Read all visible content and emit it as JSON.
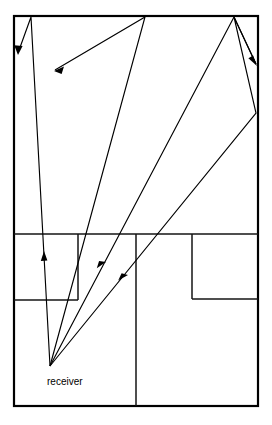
{
  "figure": {
    "type": "ray-diagram",
    "canvas": {
      "width": 272,
      "height": 425,
      "background": "#ffffff"
    },
    "stroke_color": "#000000",
    "labels": [
      {
        "id": "receiver",
        "text": "receiver",
        "x": 47,
        "y": 385
      }
    ],
    "floorplan": {
      "outer_wall": {
        "x": 14,
        "y": 16,
        "width": 244,
        "height": 390
      },
      "segments": [
        {
          "name": "corridor-divider-horizontal",
          "x1": 14,
          "y1": 234,
          "x2": 258,
          "y2": 234
        },
        {
          "name": "center-vertical-wall",
          "x1": 136,
          "y1": 234,
          "x2": 136,
          "y2": 406
        },
        {
          "name": "left-room-right-wall",
          "x1": 78,
          "y1": 234,
          "x2": 78,
          "y2": 300
        },
        {
          "name": "left-room-bottom-wall",
          "x1": 14,
          "y1": 300,
          "x2": 78,
          "y2": 300
        },
        {
          "name": "right-room-left-wall",
          "x1": 192,
          "y1": 234,
          "x2": 192,
          "y2": 299
        },
        {
          "name": "right-room-bottom-wall",
          "x1": 192,
          "y1": 299,
          "x2": 258,
          "y2": 299
        }
      ]
    },
    "receiver_point": {
      "x": 50,
      "y": 366
    },
    "rays": [
      {
        "id": "ray-1-left-wall-bounce",
        "description": "receiver to ceiling near top-left, reflects off ceiling then down to left wall",
        "points": [
          [
            50,
            366
          ],
          [
            31,
            17
          ],
          [
            18,
            53
          ]
        ],
        "arrow_at": [
          18,
          53
        ],
        "arrow_angle_deg": 110
      },
      {
        "id": "ray-2-ceiling-bounce-to-upper-left",
        "description": "receiver upward through left room, reflects at ceiling apex and travels down-left",
        "points": [
          [
            50,
            366
          ],
          [
            145,
            17
          ],
          [
            55,
            70
          ]
        ],
        "arrow_at": [
          55,
          70
        ],
        "arrow_angle_deg": 211,
        "mid_arrow_at": [
          44,
          255
        ],
        "mid_arrow_angle_deg": 285
      },
      {
        "id": "ray-3-ceiling-to-right-wall",
        "description": "receiver up-right to ceiling apex near right, reflects down to right wall",
        "points": [
          [
            50,
            366
          ],
          [
            234,
            17
          ],
          [
            256,
            64
          ]
        ],
        "arrow_at": [
          256,
          64
        ],
        "arrow_angle_deg": 64,
        "mid_arrow_at": [
          104,
          264
        ],
        "mid_arrow_angle_deg": 297
      },
      {
        "id": "ray-4-right-wall-double-bounce",
        "description": "receiver to right wall reflection point, up-left to ceiling, then down-right",
        "points": [
          [
            50,
            366
          ],
          [
            256,
            113
          ],
          [
            234,
            17
          ],
          [
            256,
            64
          ]
        ],
        "mid_arrow_at": [
          126,
          277
        ],
        "mid_arrow_angle_deg": 309
      }
    ]
  }
}
